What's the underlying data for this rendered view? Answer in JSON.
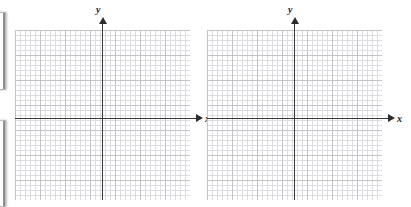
{
  "figure": {
    "background_color": "#ffffff",
    "axis_color": "#3a3a3a",
    "grid_major_color": "#c4c4c8",
    "grid_minor_color": "#dddde1",
    "grid_minor_step_px": 5,
    "grid_major_step_px": 25
  },
  "plots": [
    {
      "id": "grid-1",
      "x_axis_label": "x",
      "y_axis_label": "y",
      "x_arrow": "arrow-right",
      "y_arrow": "arrow-up",
      "tick_labels_x": [],
      "tick_labels_y": [],
      "plotted_data": []
    },
    {
      "id": "grid-2",
      "x_axis_label": "x",
      "y_axis_label": "y",
      "x_arrow": "arrow-right",
      "y_arrow": "arrow-up",
      "tick_labels_x": [],
      "tick_labels_y": [],
      "plotted_data": []
    }
  ],
  "edge_stubs": [
    {
      "id": "stub-top"
    },
    {
      "id": "stub-bottom"
    }
  ]
}
